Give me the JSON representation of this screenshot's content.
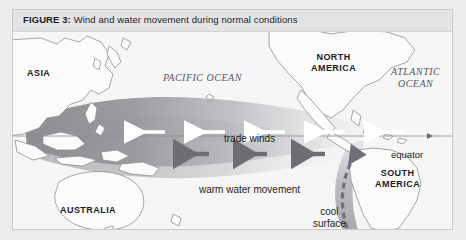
{
  "figure": {
    "number_label": "FIGURE 3:",
    "caption": "Wind and water movement during normal conditions"
  },
  "map": {
    "landmasses": [
      {
        "name": "asia",
        "label": "ASIA"
      },
      {
        "name": "australia",
        "label": "AUSTRALIA"
      },
      {
        "name": "north-america",
        "label": "NORTH\nAMERICA"
      },
      {
        "name": "south-america",
        "label": "SOUTH\nAMERICA"
      }
    ],
    "oceans": [
      {
        "name": "pacific-ocean",
        "label": "PACIFIC OCEAN"
      },
      {
        "name": "atlantic-ocean",
        "label": "ATLANTIC\nOCEAN"
      }
    ],
    "annotations": [
      {
        "name": "trade-winds",
        "label": "trade winds",
        "arrow_direction": "west",
        "arrow_count": 5,
        "arrow_color": "#ffffff"
      },
      {
        "name": "warm-water-movement",
        "label": "warm water movement",
        "arrow_direction": "west",
        "arrow_count": 3,
        "arrow_color": "#6e6e72"
      },
      {
        "name": "cool-surface-water",
        "label": "cool surface water",
        "arrow_direction": "north",
        "arrow_style": "dashed",
        "arrow_color": "#70707a"
      }
    ],
    "reference_lines": [
      {
        "name": "equator",
        "label": "equator",
        "degrees_label": "0°"
      }
    ],
    "colors": {
      "page_background": "#ececed",
      "frame_background": "#f2f2f3",
      "caption_band": "#e4e4e6",
      "ocean": "#f6f6f7",
      "land_fill": "#fbfbfb",
      "coastline": "#8f8f93",
      "warm_pool_dark": "#8e8e93",
      "cool_water": "#a8a8ad",
      "text": "#1d1d1d"
    }
  }
}
